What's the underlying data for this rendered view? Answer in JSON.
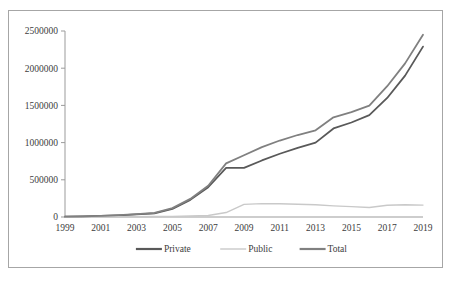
{
  "chart_data": {
    "type": "line",
    "title": "",
    "xlabel": "",
    "ylabel": "",
    "x": [
      1999,
      2000,
      2001,
      2002,
      2003,
      2004,
      2005,
      2006,
      2007,
      2008,
      2009,
      2010,
      2011,
      2012,
      2013,
      2014,
      2015,
      2016,
      2017,
      2018,
      2019
    ],
    "xlim": [
      1999,
      2019
    ],
    "ylim": [
      0,
      2500000
    ],
    "xticks": [
      1999,
      2001,
      2003,
      2005,
      2007,
      2009,
      2011,
      2013,
      2015,
      2017,
      2019
    ],
    "xtick_labels": [
      "1999",
      "2001",
      "2003",
      "2005",
      "2007",
      "2009",
      "2011",
      "2013",
      "2015",
      "2017",
      "2019"
    ],
    "yticks": [
      0,
      500000,
      1000000,
      1500000,
      2000000,
      2500000
    ],
    "ytick_labels": [
      "0",
      "500000",
      "1000000",
      "1500000",
      "2000000",
      "2500000"
    ],
    "grid": false,
    "legend_position": "bottom",
    "series": [
      {
        "name": "Private",
        "color": "#595959",
        "width": 1.8,
        "values": [
          4000,
          8000,
          14000,
          22000,
          34000,
          48000,
          110000,
          230000,
          400000,
          660000,
          660000,
          760000,
          850000,
          930000,
          1000000,
          1190000,
          1270000,
          1370000,
          1600000,
          1900000,
          2290000
        ]
      },
      {
        "name": "Public",
        "color": "#c9c9c9",
        "width": 1.4,
        "values": [
          1000,
          1500,
          2000,
          3000,
          4000,
          6000,
          9000,
          13000,
          20000,
          60000,
          170000,
          180000,
          178000,
          172000,
          165000,
          150000,
          140000,
          128000,
          158000,
          165000,
          160000
        ]
      },
      {
        "name": "Total",
        "color": "#808080",
        "width": 1.8,
        "values": [
          5000,
          9500,
          16000,
          25000,
          38000,
          54000,
          119000,
          243000,
          420000,
          720000,
          830000,
          940000,
          1028000,
          1102000,
          1165000,
          1340000,
          1410000,
          1498000,
          1758000,
          2065000,
          2450000
        ]
      }
    ]
  },
  "legend": {
    "items": [
      {
        "label": "Private",
        "color": "#595959"
      },
      {
        "label": "Public",
        "color": "#c9c9c9"
      },
      {
        "label": "Total",
        "color": "#808080"
      }
    ]
  },
  "figure": {
    "border_color": "#a6a6a6",
    "background": "#ffffff"
  }
}
